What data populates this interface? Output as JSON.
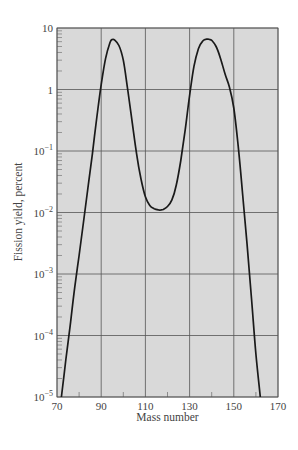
{
  "chart_data": {
    "type": "line",
    "title": "",
    "xlabel": "Mass number",
    "ylabel": "Fission yield, percent",
    "yscale": "log",
    "xlim": [
      70,
      170
    ],
    "ylim": [
      1e-05,
      10
    ],
    "grid": true,
    "legend": null,
    "x_ticks": [
      70,
      90,
      110,
      130,
      150,
      170
    ],
    "x_tick_labels": [
      "70",
      "90",
      "110",
      "130",
      "150",
      "170"
    ],
    "x_minor_ticks": [
      80,
      100,
      120,
      140,
      160
    ],
    "y_ticks": [
      10,
      1,
      0.1,
      0.01,
      0.001,
      0.0001,
      1e-05
    ],
    "y_tick_labels": [
      {
        "base": "10",
        "exp": ""
      },
      {
        "base": "1",
        "exp": ""
      },
      {
        "base": "10",
        "exp": "−1"
      },
      {
        "base": "10",
        "exp": "−2"
      },
      {
        "base": "10",
        "exp": "−3"
      },
      {
        "base": "10",
        "exp": "−4"
      },
      {
        "base": "10",
        "exp": "−5"
      }
    ],
    "series": [
      {
        "name": "Fission yield",
        "x": [
          72,
          74,
          76,
          78,
          80,
          82,
          84,
          86,
          88,
          90,
          92,
          94,
          95,
          96,
          98,
          100,
          102,
          104,
          106,
          108,
          110,
          112,
          114,
          116,
          117,
          118,
          120,
          122,
          124,
          126,
          128,
          130,
          132,
          134,
          136,
          138,
          139,
          140,
          142,
          144,
          146,
          148,
          150,
          152,
          154,
          156,
          158,
          160,
          162
        ],
        "y": [
          1e-05,
          4e-05,
          0.00015,
          0.0006,
          0.002,
          0.007,
          0.025,
          0.09,
          0.35,
          1.2,
          3.2,
          5.8,
          6.5,
          6.4,
          5.2,
          3.0,
          1.0,
          0.3,
          0.09,
          0.035,
          0.018,
          0.013,
          0.0115,
          0.011,
          0.011,
          0.0112,
          0.0125,
          0.016,
          0.028,
          0.07,
          0.22,
          0.8,
          2.4,
          4.6,
          6.2,
          6.6,
          6.5,
          6.3,
          5.0,
          3.2,
          1.8,
          1.1,
          0.5,
          0.12,
          0.02,
          0.003,
          0.0004,
          5e-05,
          1e-05
        ]
      }
    ],
    "annotations": []
  },
  "style": {
    "plot_background": "#d9d9d9",
    "grid_color": "#555555",
    "curve_color": "#1a1a1a",
    "text_color": "#444444"
  }
}
